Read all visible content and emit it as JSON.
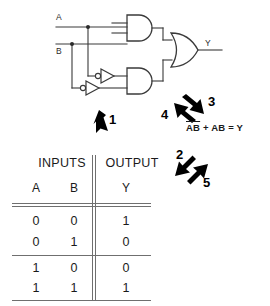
{
  "diagram": {
    "title_hidden": "",
    "circuit": {
      "input_labels": [
        "A",
        "B"
      ],
      "output_label": "Y",
      "gates": [
        {
          "type": "and-gate",
          "name": "and-gate-top"
        },
        {
          "type": "and-gate",
          "name": "and-gate-bottom"
        },
        {
          "type": "or-gate",
          "name": "or-gate"
        },
        {
          "type": "inverter",
          "name": "inverter-upper"
        },
        {
          "type": "inverter",
          "name": "inverter-lower"
        }
      ]
    },
    "equation": {
      "term1_a": "A",
      "term1_b": "B",
      "plus": "+",
      "term2": "AB",
      "equals": "=",
      "result": "Y",
      "full_text": "ĀB̄ + AB = Y"
    },
    "callouts": [
      {
        "number": "1",
        "direction": "down-left"
      },
      {
        "number": "2",
        "direction": "down-left"
      },
      {
        "number": "3",
        "direction": "down-right"
      },
      {
        "number": "4",
        "direction": "up-left"
      },
      {
        "number": "5",
        "direction": "up-right"
      }
    ],
    "truth_table": {
      "group_headers": [
        "INPUTS",
        "OUTPUT"
      ],
      "column_headers": [
        "A",
        "B",
        "Y"
      ],
      "rows": [
        [
          "0",
          "0",
          "1"
        ],
        [
          "0",
          "1",
          "0"
        ],
        [
          "1",
          "0",
          "0"
        ],
        [
          "1",
          "1",
          "1"
        ]
      ]
    },
    "colors": {
      "ink": "#000000",
      "wire": "#3a3a3a",
      "rule": "#6f6f6f",
      "background": "#ffffff"
    }
  }
}
